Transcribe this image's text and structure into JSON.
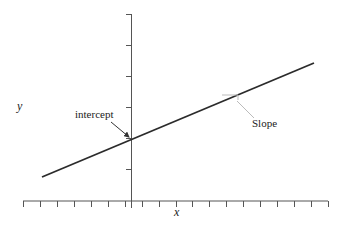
{
  "diagram": {
    "type": "linear-function-graph",
    "axes": {
      "x_label": "x",
      "y_label": "y",
      "x_axis": {
        "x1": 23,
        "x2": 328,
        "y": 201,
        "tick_count": 18,
        "tick_spacing": 18
      },
      "y_axis": {
        "x": 131,
        "y1": 14,
        "y2": 201,
        "ticks_y": [
          14,
          45,
          76,
          107,
          138,
          169
        ]
      }
    },
    "line": {
      "x1": 42,
      "y1": 177,
      "x2": 314,
      "y2": 63,
      "color": "#2b2b2b"
    },
    "annotations": {
      "intercept": {
        "label": "intercept",
        "text_x": 75,
        "text_y": 118,
        "arrow": {
          "x1": 111,
          "y1": 122,
          "x2": 129,
          "y2": 137
        }
      },
      "slope": {
        "label": "Slope",
        "text_x": 252,
        "text_y": 127,
        "triangle": {
          "x1": 222,
          "y1": 95,
          "x2": 238,
          "y2": 95,
          "x3": 238,
          "y3": 100
        },
        "leader": {
          "x1": 237,
          "y1": 101,
          "x2": 254,
          "y2": 118
        }
      }
    },
    "colors": {
      "axis": "#555555",
      "line": "#2b2b2b",
      "annotation_light": "#bbbbbb",
      "arrow": "#333333"
    }
  }
}
